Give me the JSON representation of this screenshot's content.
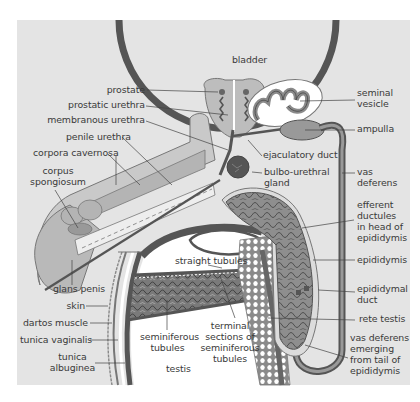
{
  "colors": {
    "panel": "#e4e4e4",
    "organ_dark": "#555555",
    "organ_mid": "#8a8a8a",
    "organ_light": "#b8b8b8",
    "organ_lighter": "#cfcfcf",
    "white": "#ffffff",
    "text": "#3a3a3a"
  },
  "labels": {
    "bladder": "bladder",
    "prostate": "prostate",
    "prostatic_urethra": "prostatic urethra",
    "membranous_urethra": "membranous urethra",
    "penile_urethra": "penile urethra",
    "corpora_cavernosa": "corpora cavernosa",
    "corpus_spongiosum_1": "corpus",
    "corpus_spongiosum_2": "spongiosum",
    "glans_penis": "glans penis",
    "skin": "skin",
    "dartos_muscle": "dartos muscle",
    "tunica_vaginalis": "tunica vaginalis",
    "tunica_albuginea_1": "tunica",
    "tunica_albuginea_2": "albuginea",
    "seminiferous_tubules_1": "seminiferous",
    "seminiferous_tubules_2": "tubules",
    "testis": "testis",
    "straight_tubules": "straight tubules",
    "terminal_sections_1": "terminal",
    "terminal_sections_2": "sections of",
    "terminal_sections_3": "seminiferous",
    "terminal_sections_4": "tubules",
    "seminal_vesicle_1": "seminal",
    "seminal_vesicle_2": "vesicle",
    "ampulla": "ampulla",
    "ejaculatory_duct": "ejaculatory duct",
    "bulbo_urethral_gland_1": "bulbo-urethral",
    "bulbo_urethral_gland_2": "gland",
    "vas_deferens_1": "vas",
    "vas_deferens_2": "deferens",
    "efferent_ductules_1": "efferent",
    "efferent_ductules_2": "ductules",
    "efferent_ductules_3": "in head of",
    "efferent_ductules_4": "epididymis",
    "epididymis": "epididymis",
    "epididymal_duct_1": "epididymal",
    "epididymal_duct_2": "duct",
    "rete_testis": "rete testis",
    "vas_deferens_emerging_1": "vas deferens",
    "vas_deferens_emerging_2": "emerging",
    "vas_deferens_emerging_3": "from tail of",
    "vas_deferens_emerging_4": "epididymis"
  }
}
